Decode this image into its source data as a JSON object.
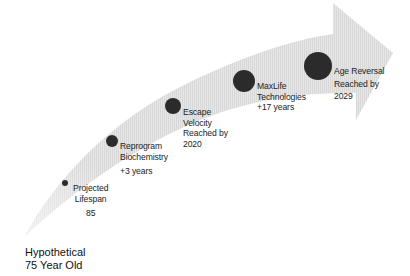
{
  "diagram": {
    "type": "curved-arrow-timeline",
    "colors": {
      "arrow_fill": "#e4e4e4",
      "arrow_stripe": "#d6d6d6",
      "milestone_dot": "#2b2b2b",
      "text": "#222222",
      "background": "#ffffff"
    },
    "start_label": {
      "line1": "Hypothetical",
      "line2": "75 Year Old"
    },
    "milestones": [
      {
        "lines": [
          "Projected",
          "Lifespan",
          "85"
        ]
      },
      {
        "lines": [
          "Reprogram",
          "Biochemistry",
          "+3 years"
        ]
      },
      {
        "lines": [
          "Escape",
          "Velocity",
          "Reached by",
          "2020"
        ]
      },
      {
        "lines": [
          "MaxLife",
          "Technologies",
          "+17 years"
        ]
      },
      {
        "lines": [
          "Age Reversal",
          "Reached by",
          "2029"
        ]
      }
    ]
  }
}
